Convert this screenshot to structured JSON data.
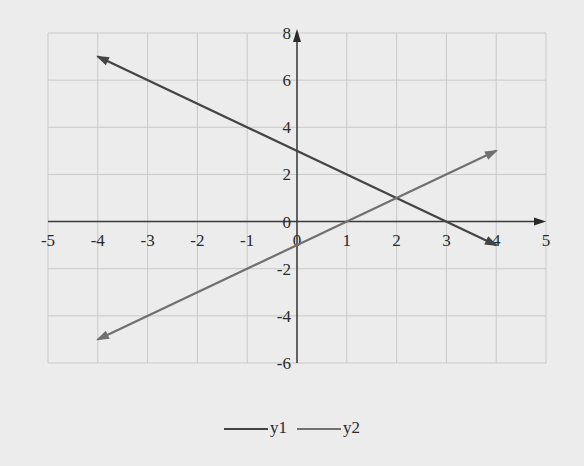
{
  "chart_data": {
    "type": "line",
    "title": "",
    "xlabel": "",
    "ylabel": "",
    "xlim": [
      -5,
      5
    ],
    "ylim": [
      -6,
      8
    ],
    "grid": true,
    "legend_position": "bottom",
    "x_ticks": [
      "-5",
      "-4",
      "-3",
      "-2",
      "-1",
      "0",
      "1",
      "2",
      "3",
      "4",
      "5"
    ],
    "y_ticks": [
      "8",
      "6",
      "4",
      "2",
      "0",
      "-2",
      "-4",
      "-6"
    ],
    "series": [
      {
        "name": "y1",
        "equation": "y = 3 - x",
        "x": [
          -4,
          0,
          1,
          2,
          3,
          4
        ],
        "values": [
          7,
          3,
          2,
          1,
          0,
          -1
        ],
        "color": "#444444"
      },
      {
        "name": "y2",
        "equation": "y = x - 1",
        "x": [
          -4,
          0,
          1,
          2,
          3,
          4
        ],
        "values": [
          -5,
          -1,
          0,
          1,
          2,
          3
        ],
        "color": "#707070"
      }
    ],
    "intersection": {
      "x": 2,
      "y": 1
    }
  },
  "legend": {
    "items": [
      {
        "label": "y1",
        "color": "#444444"
      },
      {
        "label": "y2",
        "color": "#707070"
      }
    ]
  }
}
